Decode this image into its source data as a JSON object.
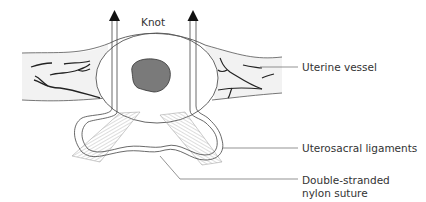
{
  "diagram": {
    "labels": {
      "knot": "Knot",
      "uterine_vessel": "Uterine vessel",
      "uterosacral_ligaments": "Uterosacral ligaments",
      "suture_line1": "Double-stranded",
      "suture_line2": "nylon suture"
    },
    "colors": {
      "stroke": "#555555",
      "cervix_fill": "#7a7a7a",
      "vessel_band": "#f1f1f1",
      "ligament_fill": "#cfcfcf",
      "text": "#333333"
    }
  }
}
